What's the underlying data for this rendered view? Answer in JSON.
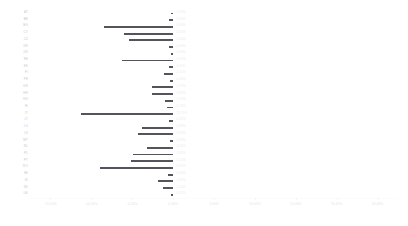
{
  "chart_data": {
    "type": "bar",
    "orientation": "horizontal",
    "title": "",
    "subtitle": "",
    "xlabel": "",
    "ylabel": "",
    "grid": false,
    "legend": null,
    "xlim": [
      -17.5,
      27.5
    ],
    "xticks": [
      -15,
      -10,
      -5,
      0,
      5,
      10,
      15,
      20,
      25
    ],
    "xtick_labels": [
      "-15.00%",
      "-10.00%",
      "-5.00%",
      "0.00%",
      "5.00%",
      "10.00%",
      "15.00%",
      "20.00%",
      "25.00%"
    ],
    "categories": [
      "AT",
      "BE",
      "BG",
      "CY",
      "CZ",
      "DE",
      "DK",
      "EE",
      "ES",
      "FI",
      "FR",
      "GR",
      "HR",
      "HU",
      "IE",
      "IT",
      "LT",
      "LU",
      "LV",
      "MT",
      "NL",
      "PL",
      "PT",
      "RO",
      "SE",
      "SI",
      "SK",
      "UK"
    ],
    "values": [
      -0.25,
      -0.55,
      -8.45,
      -6.05,
      -5.35,
      -0.45,
      -0.3,
      -6.25,
      -0.45,
      -1.15,
      -0.4,
      -2.55,
      -2.6,
      -1.05,
      -0.7,
      -11.25,
      -0.55,
      -3.85,
      -4.35,
      -0.35,
      -3.2,
      -4.95,
      -5.15,
      -8.95,
      -0.6,
      -1.85,
      -1.25,
      -0.2
    ],
    "value_labels": [
      "-0.25%",
      "-0.55%",
      "-8.45%",
      "-6.05%",
      "-5.35%",
      "-0.45%",
      "-0.30%",
      "-6.25%",
      "-0.45%",
      "-1.15%",
      "-0.40%",
      "-2.55%",
      "-2.60%",
      "-1.05%",
      "-0.70%",
      "-11.25%",
      "-0.55%",
      "-3.85%",
      "-4.35%",
      "-0.35%",
      "-3.20%",
      "-4.95%",
      "-5.15%",
      "-8.95%",
      "-0.60%",
      "-1.85%",
      "-1.25%",
      "-0.20%"
    ],
    "colors": {
      "bar": "#54545c",
      "label": "#ebebee",
      "tick": "#e4e4e8",
      "category": "#c9c9cc"
    }
  }
}
